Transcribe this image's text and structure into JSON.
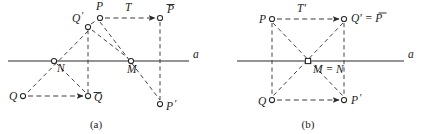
{
  "figure": {
    "title_visible": false,
    "panels": [
      {
        "id": "a",
        "caption": "(a)",
        "axis_label": "a",
        "translation_label": "T",
        "points": [
          {
            "key": "P",
            "label": "P",
            "overbar": false,
            "prime": false,
            "x": 100,
            "y": 18,
            "marker": "circle"
          },
          {
            "key": "Ptilde",
            "label": "P",
            "overbar": true,
            "prime": false,
            "x": 160,
            "y": 18,
            "marker": "circle"
          },
          {
            "key": "Qprime",
            "label": "Q",
            "overbar": false,
            "prime": true,
            "x": 88,
            "y": 27,
            "marker": "circle"
          },
          {
            "key": "N",
            "label": "N",
            "overbar": false,
            "prime": false,
            "x": 54,
            "y": 61,
            "marker": "circle"
          },
          {
            "key": "M",
            "label": "M",
            "overbar": false,
            "prime": false,
            "x": 131,
            "y": 61,
            "marker": "circle"
          },
          {
            "key": "Q",
            "label": "Q",
            "overbar": false,
            "prime": false,
            "x": 23,
            "y": 96,
            "marker": "circle"
          },
          {
            "key": "Qtilde",
            "label": "Q",
            "overbar": true,
            "prime": false,
            "x": 88,
            "y": 96,
            "marker": "circle"
          },
          {
            "key": "Pprime",
            "label": "P",
            "overbar": false,
            "prime": true,
            "x": 160,
            "y": 104,
            "marker": "circle"
          }
        ],
        "axis": {
          "x1": 8,
          "x2": 189,
          "y": 61
        }
      },
      {
        "id": "b",
        "caption": "(b)",
        "axis_label": "a",
        "translation_label": "T'",
        "points": [
          {
            "key": "P",
            "label": "P",
            "overbar": false,
            "prime": false,
            "x": 272,
            "y": 19,
            "marker": "circle"
          },
          {
            "key": "QprimeP",
            "label": "Q' = P",
            "overbar": true,
            "prime": false,
            "x": 344,
            "y": 19,
            "marker": "circle"
          },
          {
            "key": "MN",
            "label": "M = N",
            "overbar": false,
            "prime": false,
            "x": 308,
            "y": 61,
            "marker": "square"
          },
          {
            "key": "Q",
            "label": "Q",
            "overbar": false,
            "prime": false,
            "x": 272,
            "y": 100,
            "marker": "circle"
          },
          {
            "key": "Pprime",
            "label": "P",
            "overbar": false,
            "prime": true,
            "x": 344,
            "y": 100,
            "marker": "circle"
          }
        ],
        "axis": {
          "x1": 237,
          "x2": 404,
          "y": 61
        }
      }
    ],
    "colors": {
      "ink": "#1a1a1a",
      "line": "#2b2b2b",
      "dash": "#3a3a3a",
      "background": "#ffffff"
    }
  },
  "labels": {
    "a_panel": {
      "P": "P",
      "P_tilde": "P",
      "Q_prime": "Q",
      "N": "N",
      "M": "M",
      "Q": "Q",
      "Q_tilde": "Q",
      "P_prime": "P",
      "T": "T",
      "axis": "a",
      "caption": "(a)"
    },
    "b_panel": {
      "P": "P",
      "Qprime_eq_Ptilde": "Q′ = P",
      "M_eq_N": "M = N",
      "Q": "Q",
      "P_prime": "P",
      "T_prime": "T′",
      "axis": "a",
      "caption": "(b)"
    }
  }
}
